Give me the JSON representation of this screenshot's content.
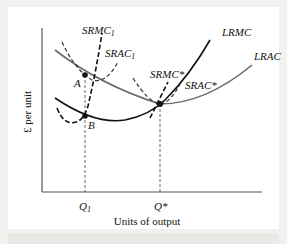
{
  "figure": {
    "type": "cost-curves-diagram",
    "y_axis_label": "£ per unit",
    "x_axis_label": "Units of output",
    "x_ticks": [
      {
        "label": "Q",
        "sub": "1",
        "x": 85
      },
      {
        "label": "Q*",
        "sub": "",
        "x": 160
      }
    ],
    "points": [
      {
        "label": "A",
        "x": 85,
        "y": 75
      },
      {
        "label": "B",
        "x": 85,
        "y": 116
      },
      {
        "label": "",
        "x": 160,
        "y": 104
      }
    ],
    "curves": [
      {
        "name": "LRMC",
        "style": "solid",
        "color": "#111111"
      },
      {
        "name": "LRAC",
        "style": "solid",
        "color": "#6b6b6b"
      },
      {
        "name": "SRMC",
        "sub": "1",
        "style": "dashed",
        "color": "#111111"
      },
      {
        "name": "SRAC",
        "sub": "1",
        "style": "dashed",
        "color": "#333333"
      },
      {
        "name": "SRMC*",
        "style": "dashed",
        "color": "#111111"
      },
      {
        "name": "SRAC*",
        "style": "dashed",
        "color": "#333333"
      }
    ],
    "labels": {
      "lrmc": "LRMC",
      "lrac": "LRAC",
      "srmc1": "SRMC",
      "srmc1_sub": "1",
      "srac1": "SRAC",
      "srac1_sub": "1",
      "srmc_star": "SRMC*",
      "srac_star": "SRAC*",
      "a": "A",
      "b": "B",
      "q1": "Q",
      "q1_sub": "1",
      "qstar": "Q*"
    }
  },
  "colors": {
    "background": "#f1f1ef",
    "panel": "#ffffff",
    "axis": "#555555",
    "ink": "#111111",
    "lrac": "#6b6b6b"
  }
}
